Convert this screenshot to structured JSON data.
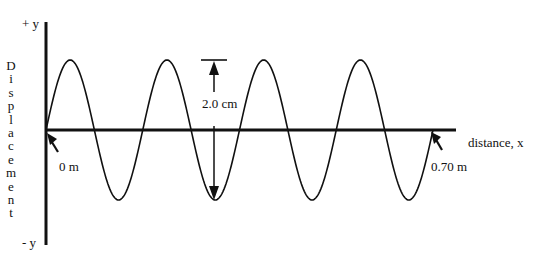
{
  "diagram": {
    "y_axis": {
      "top_label": "+ y",
      "bottom_label": "- y",
      "title": "Displacement"
    },
    "x_axis": {
      "title": "distance, x"
    },
    "annotations": {
      "start_marker": "0 m",
      "end_marker": "0.70 m",
      "amplitude_span": "2.0 cm"
    },
    "wave": {
      "wavelengths_shown": 4,
      "total_length_m": 0.7,
      "peak_to_trough_cm": 2.0,
      "color": "#111111"
    }
  }
}
